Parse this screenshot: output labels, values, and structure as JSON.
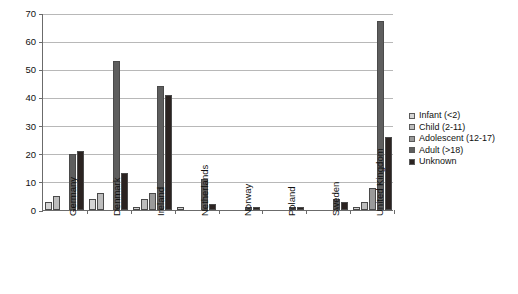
{
  "chart_data": {
    "type": "bar",
    "title": "",
    "subtitle": "",
    "xlabel": "",
    "ylabel": "",
    "ylim": [
      0,
      70
    ],
    "ytick_step": 10,
    "yticks": [
      0,
      10,
      20,
      30,
      40,
      50,
      60,
      70
    ],
    "grid": true,
    "legend_position": "right",
    "categories": [
      "Germany",
      "Denmark",
      "Ireland",
      "Netherlands",
      "Norway",
      "Poland",
      "Sweden",
      "United Kingdom"
    ],
    "series": [
      {
        "name": "Infant (<2)",
        "color": "#d4d4d4",
        "values": [
          3,
          4,
          1,
          1,
          0,
          0,
          0,
          1
        ]
      },
      {
        "name": "Child (2-11)",
        "color": "#bdbdbd",
        "values": [
          5,
          6,
          4,
          0,
          0,
          0,
          0,
          3
        ]
      },
      {
        "name": "Adolescent (12-17)",
        "color": "#9a9a9a",
        "values": [
          0,
          0,
          6,
          0,
          0,
          0,
          0,
          8
        ]
      },
      {
        "name": "Adult (>18)",
        "color": "#5e5e5e",
        "values": [
          20,
          53,
          44,
          11,
          1,
          1,
          4,
          67
        ]
      },
      {
        "name": "Unknown",
        "color": "#2b2321",
        "values": [
          21,
          13,
          41,
          2,
          1,
          1,
          3,
          26
        ]
      }
    ]
  },
  "axis": {
    "y_tick_labels": [
      "0",
      "10",
      "20",
      "30",
      "40",
      "50",
      "60",
      "70"
    ]
  },
  "legend": {
    "items": [
      {
        "label": "Infant (<2)"
      },
      {
        "label": "Child (2-11)"
      },
      {
        "label": "Adolescent (12-17)"
      },
      {
        "label": "Adult (>18)"
      },
      {
        "label": "Unknown"
      }
    ]
  }
}
